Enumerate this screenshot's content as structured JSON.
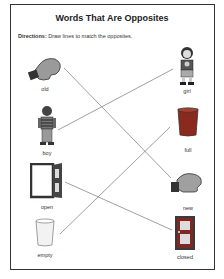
{
  "worksheet": {
    "title": "Words That Are Opposites",
    "directions_label": "Directions:",
    "directions_text": " Draw lines to match the opposites."
  },
  "left_column": [
    {
      "word": "old",
      "icon": "worn-mitten-icon"
    },
    {
      "word": "boy",
      "icon": "boy-icon"
    },
    {
      "word": "open",
      "icon": "open-door-icon"
    },
    {
      "word": "empty",
      "icon": "empty-glass-icon"
    }
  ],
  "right_column": [
    {
      "word": "girl",
      "icon": "girl-icon"
    },
    {
      "word": "full",
      "icon": "full-glass-icon"
    },
    {
      "word": "new",
      "icon": "new-mitten-icon"
    },
    {
      "word": "closed",
      "icon": "closed-door-icon"
    }
  ],
  "matches": [
    {
      "from": "old",
      "to": "new"
    },
    {
      "from": "boy",
      "to": "girl"
    },
    {
      "from": "open",
      "to": "closed"
    },
    {
      "from": "empty",
      "to": "full"
    }
  ],
  "colors": {
    "border": "#333333",
    "line": "#777777",
    "full_glass": "#8a2a1e",
    "door": "#3a3a3a",
    "closed_door_frame": "#7a2a22"
  }
}
